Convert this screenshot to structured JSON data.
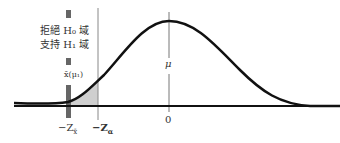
{
  "diagram": {
    "type": "normal-distribution-hypothesis-test",
    "labels": {
      "reject_region_line1": "拒絕 H₀ 域",
      "reject_region_line2": "支持 H₁ 域",
      "xbar_mu1": "x̄(μ₁)",
      "mu": "μ",
      "zero": "0",
      "neg_z_xbar": "−Z",
      "neg_z_xbar_sub": "x̄",
      "neg_z_alpha": "−Z",
      "neg_z_alpha_sub": "α"
    },
    "colors": {
      "curve": "#111111",
      "shade": "#cfcfcf",
      "marker_bar": "#666666",
      "guide_line": "#888888"
    }
  }
}
